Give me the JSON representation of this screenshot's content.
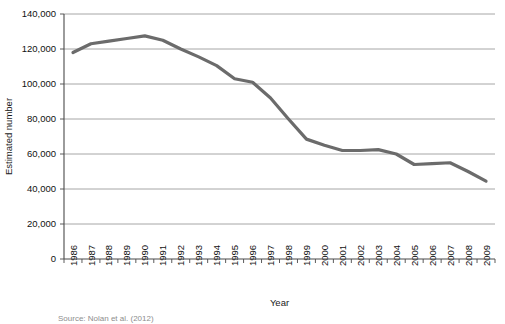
{
  "chart_data": {
    "type": "line",
    "title": "",
    "xlabel": "Year",
    "ylabel": "Estimated number",
    "categories": [
      "1986",
      "1987",
      "1988",
      "1989",
      "1990",
      "1991",
      "1992",
      "1993",
      "1994",
      "1995",
      "1996",
      "1997",
      "1998",
      "1999",
      "2000",
      "2001",
      "2002",
      "2003",
      "2004",
      "2005",
      "2006",
      "2007",
      "2008",
      "2009"
    ],
    "values": [
      118000,
      123000,
      124500,
      126000,
      127500,
      125000,
      120000,
      115500,
      110500,
      103000,
      101000,
      92000,
      80000,
      68500,
      65000,
      62000,
      62000,
      62500,
      60000,
      54000,
      54500,
      55000,
      50000,
      44500
    ],
    "series": [
      {
        "name": "Estimated number",
        "values": [
          118000,
          123000,
          124500,
          126000,
          127500,
          125000,
          120000,
          115500,
          110500,
          103000,
          101000,
          92000,
          80000,
          68500,
          65000,
          62000,
          62000,
          62500,
          60000,
          54000,
          54500,
          55000,
          50000,
          44500
        ]
      }
    ],
    "ylim": [
      0,
      140000
    ],
    "ytick_values": [
      0,
      20000,
      40000,
      60000,
      80000,
      100000,
      120000,
      140000
    ],
    "ytick_labels": [
      "0",
      "20,000",
      "40,000",
      "60,000",
      "80,000",
      "100,000",
      "120,000",
      "140,000"
    ],
    "grid": true,
    "grid_axis": "y",
    "legend": false,
    "legend_position": "none",
    "line_color": "#6b6b6b",
    "grid_color": "#8f8f8f",
    "axis_color": "#4a4a4a"
  },
  "source": {
    "text": "Source: Nolan et al. (2012)"
  }
}
